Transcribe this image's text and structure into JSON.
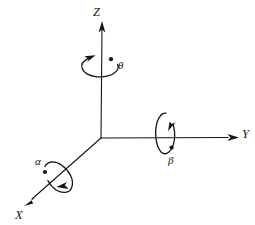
{
  "figure": {
    "kind": "diagram",
    "background_color": "#ffffff",
    "stroke_color": "#151515",
    "width": 255,
    "height": 225
  },
  "origin": {
    "x": 101,
    "y": 138
  },
  "axes": [
    {
      "name": "z-axis",
      "label": "Z",
      "direction": "up",
      "start": {
        "x": 101,
        "y": 138
      },
      "end": {
        "x": 102,
        "y": 22
      },
      "arrow": "at-end",
      "label_position": {
        "x": 93,
        "y": 6
      }
    },
    {
      "name": "y-axis",
      "label": "Y",
      "direction": "right",
      "start": {
        "x": 101,
        "y": 138
      },
      "end": {
        "x": 238,
        "y": 137
      },
      "arrow": "at-end",
      "label_position": {
        "x": 242,
        "y": 128
      }
    },
    {
      "name": "x-axis",
      "label": "X",
      "direction": "down-left",
      "start": {
        "x": 101,
        "y": 138
      },
      "end": {
        "x": 25,
        "y": 205
      },
      "arrow": "at-end",
      "label_position": {
        "x": 15,
        "y": 209
      }
    }
  ],
  "rotations": [
    {
      "name": "theta-rotation",
      "label": "θ",
      "about_axis": "Z",
      "ellipse": {
        "cx": 100,
        "cy": 67,
        "rx": 18,
        "ry": 10,
        "rotation_deg": 0
      },
      "arrow_direction": "counter-clockwise",
      "dot": {
        "x": 111,
        "y": 59
      },
      "label_position": {
        "x": 118,
        "y": 60
      }
    },
    {
      "name": "beta-rotation",
      "label": "β",
      "about_axis": "Y",
      "ellipse": {
        "cx": 165,
        "cy": 134,
        "rx": 10,
        "ry": 21,
        "rotation_deg": 0
      },
      "arrow_direction": "counter-clockwise",
      "dot": {
        "x": 172,
        "y": 148
      },
      "label_position": {
        "x": 168,
        "y": 155
      }
    },
    {
      "name": "alpha-rotation",
      "label": "α",
      "about_axis": "X",
      "ellipse": {
        "cx": 58,
        "cy": 177,
        "rx": 11,
        "ry": 17,
        "rotation_deg": -41
      },
      "arrow_direction": "counter-clockwise",
      "dot": {
        "x": 45,
        "y": 172
      },
      "label_position": {
        "x": 35,
        "y": 156
      }
    }
  ]
}
